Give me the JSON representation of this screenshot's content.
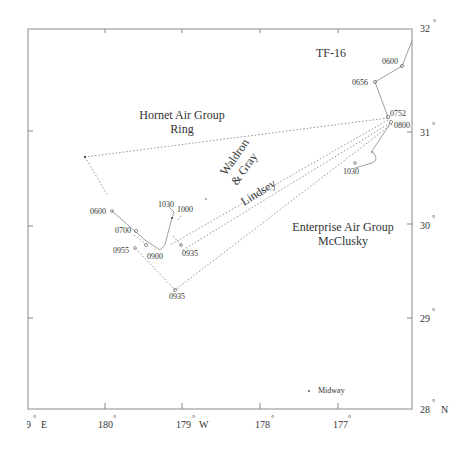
{
  "map": {
    "region_labels": {
      "hornet_line1": "Hornet Air Group",
      "hornet_line2": "Ring",
      "waldron_line1": "Waldron",
      "waldron_line2": "& Gray",
      "lindsey": "Lindsey",
      "enterprise_line1": "Enterprise Air Group",
      "enterprise_line2": "McClusky",
      "tf16": "TF-16",
      "midway": "Midway"
    },
    "time_labels": {
      "tf16_0600": "0600",
      "tf16_0656": "0656",
      "tf16_0752": "0752",
      "tf16_0800": "0800",
      "tf16_1030": "1030",
      "west_0600": "0600",
      "west_0700": "0700",
      "west_0955": "0955",
      "west_0900": "0900",
      "west_1030": "1030",
      "west_1000": "1000",
      "west_0935a": "0935",
      "west_0935b": "0935"
    },
    "lat_ticks": [
      {
        "label": "32",
        "deg": "°"
      },
      {
        "label": "31",
        "deg": "°"
      },
      {
        "label": "30",
        "deg": "°"
      },
      {
        "label": "29",
        "deg": "°"
      },
      {
        "label": "28",
        "deg": "°",
        "suffix": "N"
      }
    ],
    "lon_ticks": [
      {
        "label": "79",
        "deg": "°",
        "suffix": "E"
      },
      {
        "label": "180",
        "deg": "°"
      },
      {
        "label": "179",
        "deg": "°",
        "suffix": "W"
      },
      {
        "label": "178",
        "deg": "°"
      },
      {
        "label": "177",
        "deg": "°"
      }
    ]
  }
}
